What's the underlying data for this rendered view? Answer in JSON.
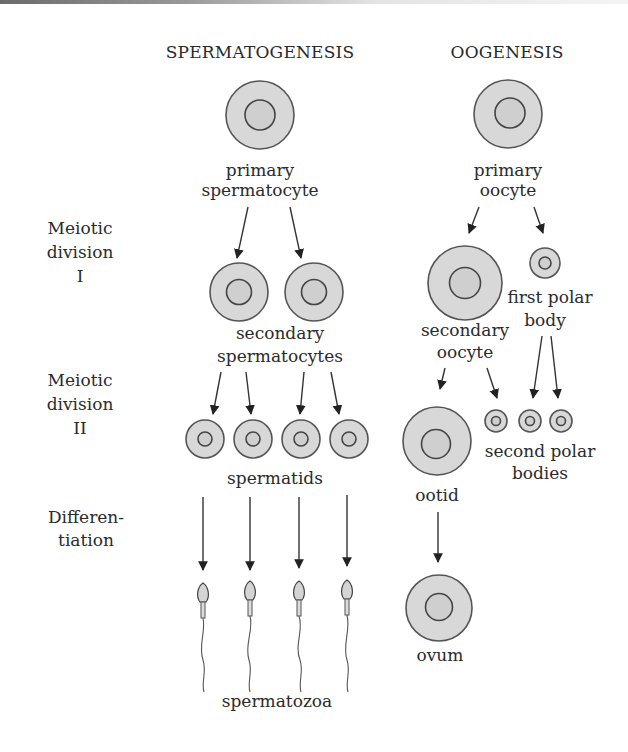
{
  "titles": {
    "spermatogenesis": "SPERMATOGENESIS",
    "oogenesis": "OOGENESIS"
  },
  "stages": {
    "meiosis1": [
      "Meiotic",
      "division",
      "I"
    ],
    "meiosis2": [
      "Meiotic",
      "division",
      "II"
    ],
    "differentiation": [
      "Differen-",
      "tiation"
    ]
  },
  "spermatogenesis": {
    "primary_spermatocyte": [
      "primary",
      "spermatocyte"
    ],
    "secondary_spermatocytes": [
      "secondary",
      "spermatocytes"
    ],
    "spermatids": "spermatids",
    "spermatozoa": "spermatozoa",
    "counts": {
      "primary": 1,
      "secondary": 2,
      "spermatids": 4,
      "spermatozoa": 4
    }
  },
  "oogenesis": {
    "primary_oocyte": [
      "primary",
      "oocyte"
    ],
    "secondary_oocyte": [
      "secondary",
      "oocyte"
    ],
    "first_polar_body": [
      "first polar",
      "body"
    ],
    "ootid": "ootid",
    "second_polar_bodies": [
      "second polar",
      "bodies"
    ],
    "ovum": "ovum",
    "counts": {
      "primary": 1,
      "secondary_oocyte": 1,
      "first_polar_body": 1,
      "ootid": 1,
      "second_polar_bodies": 3,
      "ovum": 1
    }
  },
  "colors": {
    "cytoplasm": "#d8d8d8",
    "outline": "#555555",
    "text": "#2a2a2a"
  }
}
